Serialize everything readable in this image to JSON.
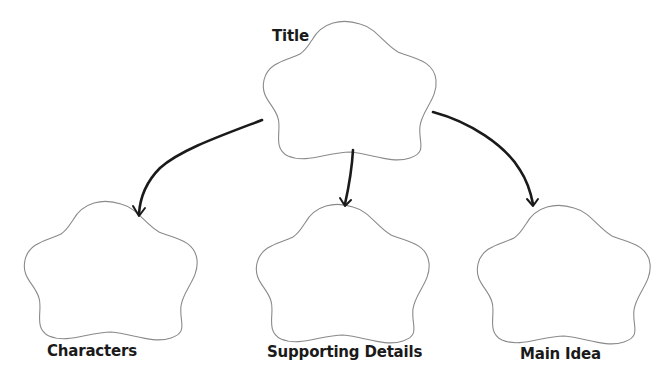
{
  "diagram": {
    "type": "graphic-organizer",
    "nodes": [
      {
        "id": "title",
        "label": "Title",
        "shape": "cloud",
        "content": ""
      },
      {
        "id": "characters",
        "label": "Characters",
        "shape": "cloud",
        "content": ""
      },
      {
        "id": "supporting_details",
        "label": "Supporting Details",
        "shape": "cloud",
        "content": ""
      },
      {
        "id": "main_idea",
        "label": "Main Idea",
        "shape": "cloud",
        "content": ""
      }
    ],
    "edges": [
      {
        "from": "title",
        "to": "characters",
        "style": "hand-drawn-arrow"
      },
      {
        "from": "title",
        "to": "supporting_details",
        "style": "hand-drawn-arrow"
      },
      {
        "from": "title",
        "to": "main_idea",
        "style": "hand-drawn-arrow"
      }
    ],
    "colors": {
      "cloud_outline": "#8a8a8a",
      "arrow": "#1a1a1a",
      "text": "#1a1a1a",
      "background": "#ffffff"
    }
  },
  "labels": {
    "title": "Title",
    "characters": "Characters",
    "supporting_details": "Supporting Details",
    "main_idea": "Main Idea"
  }
}
